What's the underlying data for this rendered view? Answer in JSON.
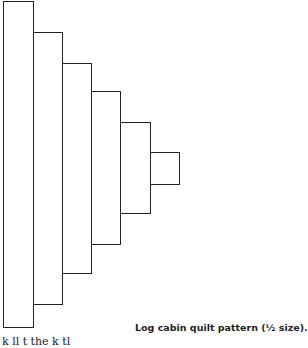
{
  "figure": {
    "caption": "Log cabin quilt pattern (½ size).",
    "rectangles": [
      {
        "x": 3,
        "y": 1,
        "w": 31,
        "h": 327
      },
      {
        "x": 33,
        "y": 32,
        "w": 30,
        "h": 273
      },
      {
        "x": 62,
        "y": 63,
        "w": 30,
        "h": 211
      },
      {
        "x": 91,
        "y": 91,
        "w": 30,
        "h": 154
      },
      {
        "x": 120,
        "y": 122,
        "w": 31,
        "h": 92
      },
      {
        "x": 150,
        "y": 152,
        "w": 30,
        "h": 33
      }
    ]
  },
  "body_text": {
    "cutoff_line": "k   ll    t    the   k   tl"
  }
}
